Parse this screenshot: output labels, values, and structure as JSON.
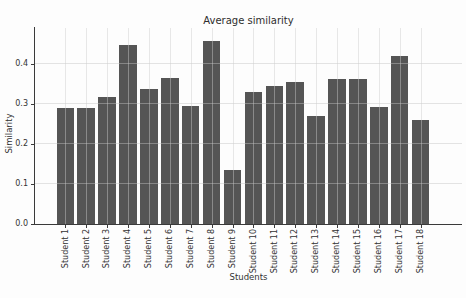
{
  "chart_data": {
    "type": "bar",
    "title": "Average similarity",
    "xlabel": "Students",
    "ylabel": "Similarity",
    "categories": [
      "Student 1",
      "Student 2",
      "Student 3",
      "Student 4",
      "Student 5",
      "Student 6",
      "Student 7",
      "Student 8",
      "Student 9",
      "Student 10",
      "Student 11",
      "Student 12",
      "Student 13",
      "Student 14",
      "Student 15",
      "Student 16",
      "Student 17",
      "Student 18"
    ],
    "values": [
      0.29,
      0.29,
      0.318,
      0.448,
      0.337,
      0.366,
      0.296,
      0.457,
      0.134,
      0.331,
      0.344,
      0.355,
      0.27,
      0.362,
      0.362,
      0.292,
      0.421,
      0.261
    ],
    "ytick_labels": [
      "0.0",
      "0.1",
      "0.2",
      "0.3",
      "0.4"
    ],
    "ytick_values": [
      0.0,
      0.1,
      0.2,
      0.3,
      0.4
    ],
    "ylim": [
      0,
      0.49
    ],
    "bar_color": "#555555",
    "grid": true,
    "grid_over_bars": true,
    "legend_position": "none"
  }
}
